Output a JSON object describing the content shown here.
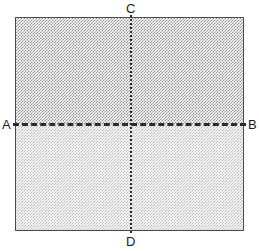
{
  "figure": {
    "shape": "square",
    "labels": {
      "a": "A",
      "b": "B",
      "c": "C",
      "d": "D"
    },
    "lines": {
      "horizontal": {
        "name": "AB",
        "style": "dashed",
        "from": "A",
        "to": "B",
        "color": "#2b2b2b"
      },
      "vertical": {
        "name": "CD",
        "style": "dotted",
        "from": "C",
        "to": "D",
        "color": "#2b2b2b"
      }
    },
    "regions": {
      "top": {
        "name": "upper-half",
        "fill": "dense-stipple",
        "color": "#8d8d8d"
      },
      "bottom": {
        "name": "lower-half",
        "fill": "light-stipple",
        "color": "#b9b9b9"
      }
    },
    "border_color": "#4a4a4a",
    "background_color": "#ffffff"
  }
}
